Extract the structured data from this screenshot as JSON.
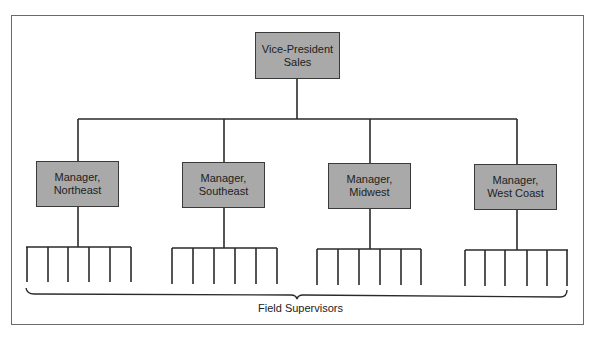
{
  "chart": {
    "type": "org-chart",
    "root": {
      "label": "Vice-President\nSales"
    },
    "managers": [
      {
        "label": "Manager,\nNortheast"
      },
      {
        "label": "Manager,\nSoutheast"
      },
      {
        "label": "Manager,\nMidwest"
      },
      {
        "label": "Manager,\nWest Coast"
      }
    ],
    "supervisors_per_manager": 6,
    "group_label": "Field Supervisors"
  },
  "colors": {
    "box_fill": "#a9a9a9",
    "line": "#2a2a2a"
  }
}
